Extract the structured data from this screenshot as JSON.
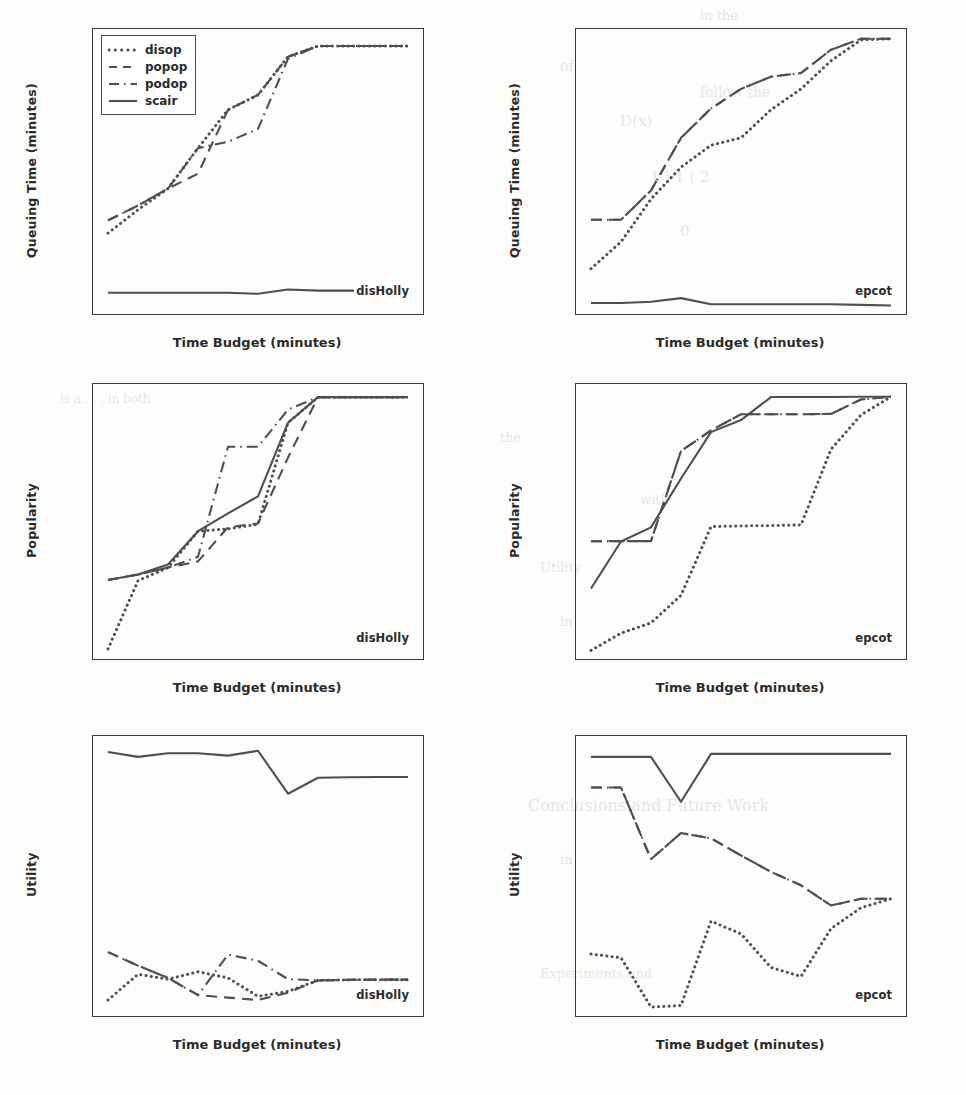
{
  "figure": {
    "xlabel": "Time Budget (minutes)",
    "xticks": [
      60,
      90,
      120,
      150,
      180,
      210,
      240,
      270,
      300,
      330,
      360
    ],
    "xlim": [
      45,
      375
    ],
    "legend": {
      "position": "upper-left",
      "entries": [
        {
          "label": "disop",
          "style": "dotted"
        },
        {
          "label": "popop",
          "style": "dashed"
        },
        {
          "label": "podop",
          "style": "dashdot"
        },
        {
          "label": "scair",
          "style": "solid"
        }
      ]
    },
    "line_color": "#4f4f4f",
    "axis_color": "#3a3a3a"
  },
  "chart_data": [
    {
      "id": "queuing-disholly",
      "type": "line",
      "title": "",
      "annotation": "disHolly",
      "xlabel": "Time Budget (minutes)",
      "ylabel": "Queuing Time (minutes)",
      "x": [
        60,
        90,
        120,
        150,
        180,
        210,
        240,
        270,
        300,
        330,
        360
      ],
      "xticks": [
        60,
        90,
        120,
        150,
        180,
        210,
        240,
        270,
        300,
        330,
        360
      ],
      "yticks": [
        0,
        2,
        4,
        6,
        8,
        10,
        12
      ],
      "xlim": [
        45,
        375
      ],
      "ylim": [
        -0.5,
        12.9
      ],
      "grid": false,
      "legend": "upper left",
      "series": [
        {
          "name": "disop",
          "style": "dotted",
          "values": [
            3.3,
            4.4,
            5.4,
            7.3,
            9.1,
            9.8,
            11.6,
            12.1,
            12.1,
            12.1,
            12.1
          ]
        },
        {
          "name": "popop",
          "style": "dashed",
          "values": [
            3.9,
            4.6,
            5.4,
            6.1,
            9.1,
            9.8,
            11.6,
            12.1,
            12.1,
            12.1,
            12.1
          ]
        },
        {
          "name": "podop",
          "style": "dashdot",
          "values": [
            3.9,
            4.6,
            5.4,
            7.3,
            7.6,
            8.2,
            11.5,
            12.1,
            12.1,
            12.1,
            12.1
          ]
        },
        {
          "name": "scair",
          "style": "solid",
          "values": [
            0.5,
            0.5,
            0.5,
            0.5,
            0.5,
            0.45,
            0.65,
            0.6,
            0.6,
            0.6,
            0.6
          ]
        }
      ]
    },
    {
      "id": "queuing-epcot",
      "type": "line",
      "title": "",
      "annotation": "epcot",
      "xlabel": "Time Budget (minutes)",
      "ylabel": "Queuing Time (minutes)",
      "x": [
        60,
        90,
        120,
        150,
        180,
        210,
        240,
        270,
        300,
        330,
        360
      ],
      "xticks": [
        60,
        90,
        120,
        150,
        180,
        210,
        240,
        270,
        300,
        330,
        360
      ],
      "yticks": [
        5,
        10,
        15,
        20
      ],
      "xlim": [
        45,
        375
      ],
      "ylim": [
        1.2,
        24.5
      ],
      "grid": false,
      "legend": "none",
      "series": [
        {
          "name": "disop",
          "style": "dotted",
          "values": [
            4.9,
            7.1,
            10.6,
            13.2,
            15.0,
            15.6,
            17.9,
            19.6,
            21.9,
            23.6,
            23.7
          ]
        },
        {
          "name": "popop",
          "style": "dashed",
          "values": [
            8.9,
            8.9,
            11.3,
            15.6,
            18.0,
            19.6,
            20.6,
            20.9,
            22.8,
            23.7,
            23.7
          ]
        },
        {
          "name": "podop",
          "style": "dashdot",
          "values": [
            8.9,
            8.9,
            11.3,
            15.6,
            18.0,
            19.6,
            20.6,
            20.9,
            22.8,
            23.7,
            23.7
          ]
        },
        {
          "name": "scair",
          "style": "solid",
          "values": [
            2.1,
            2.1,
            2.2,
            2.5,
            2.0,
            2.0,
            2.0,
            2.0,
            2.0,
            1.95,
            1.9
          ]
        }
      ]
    },
    {
      "id": "popularity-disholly",
      "type": "line",
      "title": "",
      "annotation": "disHolly",
      "xlabel": "Time Budget (minutes)",
      "ylabel": "Popularity",
      "x": [
        60,
        90,
        120,
        150,
        180,
        210,
        240,
        270,
        300,
        330,
        360
      ],
      "xticks": [
        60,
        90,
        120,
        150,
        180,
        210,
        240,
        270,
        300,
        330,
        360
      ],
      "yticks": [
        10000,
        15000,
        20000,
        25000,
        30000,
        35000,
        40000
      ],
      "xlim": [
        45,
        375
      ],
      "ylim": [
        7000,
        42500
      ],
      "grid": false,
      "legend": "none",
      "series": [
        {
          "name": "disop",
          "style": "dotted",
          "values": [
            8300,
            17100,
            18800,
            23500,
            23800,
            24400,
            37500,
            40800,
            40800,
            40800,
            40800
          ]
        },
        {
          "name": "popop",
          "style": "dashed",
          "values": [
            17200,
            17900,
            18800,
            19600,
            24000,
            24500,
            33000,
            40800,
            40800,
            40800,
            40800
          ]
        },
        {
          "name": "podop",
          "style": "dashdot",
          "values": [
            17200,
            17900,
            18800,
            20200,
            34400,
            34400,
            39200,
            40800,
            40800,
            40800,
            40800
          ]
        },
        {
          "name": "scair",
          "style": "solid",
          "values": [
            17200,
            17900,
            19200,
            23500,
            25800,
            28000,
            37500,
            40800,
            40800,
            40800,
            40800
          ]
        }
      ]
    },
    {
      "id": "popularity-epcot",
      "type": "line",
      "title": "",
      "annotation": "epcot",
      "xlabel": "Time Budget (minutes)",
      "ylabel": "Popularity",
      "x": [
        60,
        90,
        120,
        150,
        180,
        210,
        240,
        270,
        300,
        330,
        360
      ],
      "xticks": [
        60,
        90,
        120,
        150,
        180,
        210,
        240,
        270,
        300,
        330,
        360
      ],
      "yticks": [
        20000,
        30000,
        40000,
        50000,
        60000,
        70000,
        80000,
        90000
      ],
      "xlim": [
        45,
        375
      ],
      "ylim": [
        12000,
        92000
      ],
      "grid": false,
      "legend": "none",
      "series": [
        {
          "name": "disop",
          "style": "dotted",
          "values": [
            14500,
            19500,
            22500,
            30500,
            50500,
            50700,
            50800,
            51000,
            73000,
            83000,
            88300
          ]
        },
        {
          "name": "popop",
          "style": "dashed",
          "values": [
            46300,
            46300,
            46300,
            72500,
            78500,
            83200,
            83200,
            83200,
            83300,
            87500,
            88300
          ]
        },
        {
          "name": "podop",
          "style": "dashdot",
          "values": [
            46300,
            46300,
            46300,
            72500,
            78500,
            83200,
            83200,
            83200,
            83300,
            87500,
            88300
          ]
        },
        {
          "name": "scair",
          "style": "solid",
          "values": [
            32500,
            46200,
            50300,
            64500,
            78000,
            81500,
            88200,
            88200,
            88200,
            88300,
            88300
          ]
        }
      ]
    },
    {
      "id": "utility-disholly",
      "type": "line",
      "title": "",
      "annotation": "disHolly",
      "xlabel": "Time Budget (minutes)",
      "ylabel": "Utility",
      "x": [
        60,
        90,
        120,
        150,
        180,
        210,
        240,
        270,
        300,
        330,
        360
      ],
      "xticks": [
        60,
        90,
        120,
        150,
        180,
        210,
        240,
        270,
        300,
        330,
        360
      ],
      "yticks": [
        2000,
        4000,
        6000,
        8000,
        10000,
        12000
      ],
      "xlim": [
        45,
        375
      ],
      "ylim": [
        1900,
        13300
      ],
      "grid": false,
      "legend": "none",
      "series": [
        {
          "name": "disop",
          "style": "dotted",
          "values": [
            2550,
            3600,
            3400,
            3700,
            3450,
            2700,
            2900,
            3350,
            3370,
            3380,
            3380
          ]
        },
        {
          "name": "popop",
          "style": "dashed",
          "values": [
            4500,
            3950,
            3450,
            2750,
            2650,
            2550,
            2850,
            3350,
            3370,
            3380,
            3380
          ]
        },
        {
          "name": "podop",
          "style": "dashdot",
          "values": [
            4500,
            3950,
            3450,
            2750,
            4400,
            4150,
            3400,
            3350,
            3370,
            3380,
            3380
          ]
        },
        {
          "name": "scair",
          "style": "solid",
          "values": [
            12650,
            12450,
            12600,
            12600,
            12500,
            12700,
            10950,
            11600,
            11620,
            11630,
            11630
          ]
        }
      ]
    },
    {
      "id": "utility-epcot",
      "type": "line",
      "title": "",
      "annotation": "epcot",
      "xlabel": "Time Budget (minutes)",
      "ylabel": "Utility",
      "x": [
        60,
        90,
        120,
        150,
        180,
        210,
        240,
        270,
        300,
        330,
        360
      ],
      "xticks": [
        60,
        90,
        120,
        150,
        180,
        210,
        240,
        270,
        300,
        330,
        360
      ],
      "yticks": [
        2500,
        3000,
        3500,
        4000,
        4500,
        5000,
        5500
      ],
      "xlim": [
        45,
        375
      ],
      "ylim": [
        2150,
        5900
      ],
      "grid": false,
      "legend": "none",
      "series": [
        {
          "name": "disop",
          "style": "dotted",
          "values": [
            2980,
            2930,
            2270,
            2290,
            3420,
            3250,
            2800,
            2680,
            3320,
            3600,
            3720
          ]
        },
        {
          "name": "popop",
          "style": "dashed",
          "values": [
            5210,
            5210,
            4250,
            4600,
            4530,
            4300,
            4080,
            3900,
            3630,
            3720,
            3720
          ]
        },
        {
          "name": "podop",
          "style": "dashdot",
          "values": [
            5210,
            5210,
            4250,
            4600,
            4530,
            4300,
            4080,
            3900,
            3630,
            3720,
            3720
          ]
        },
        {
          "name": "scair",
          "style": "solid",
          "values": [
            5620,
            5620,
            5620,
            5020,
            5660,
            5660,
            5660,
            5660,
            5660,
            5660,
            5660
          ]
        }
      ]
    }
  ],
  "background_text": [
    {
      "t": "in the",
      "x": 700,
      "y": 8,
      "s": 13
    },
    {
      "t": "of",
      "x": 560,
      "y": 58,
      "s": 14
    },
    {
      "t": "follow the",
      "x": 700,
      "y": 84,
      "s": 14
    },
    {
      "t": "D(x)",
      "x": 620,
      "y": 112,
      "s": 15
    },
    {
      "t": "1 ) 1 ( 2",
      "x": 650,
      "y": 168,
      "s": 15
    },
    {
      "t": "0",
      "x": 680,
      "y": 222,
      "s": 15
    },
    {
      "t": "is a . . . in both",
      "x": 60,
      "y": 392,
      "s": 12
    },
    {
      "t": "the",
      "x": 500,
      "y": 430,
      "s": 13
    },
    {
      "t": "with",
      "x": 640,
      "y": 492,
      "s": 13
    },
    {
      "t": "Utility",
      "x": 540,
      "y": 560,
      "s": 13
    },
    {
      "t": "in",
      "x": 560,
      "y": 614,
      "s": 13
    },
    {
      "t": "Conclusions and Future Work",
      "x": 528,
      "y": 796,
      "s": 16
    },
    {
      "t": "in",
      "x": 560,
      "y": 852,
      "s": 13
    },
    {
      "t": "Experiments and",
      "x": 540,
      "y": 966,
      "s": 13
    }
  ]
}
